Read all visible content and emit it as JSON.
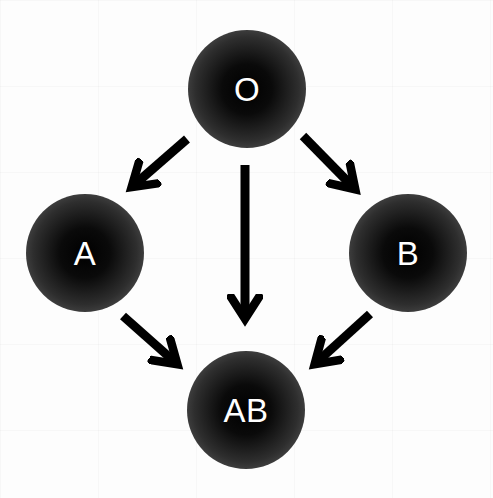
{
  "diagram": {
    "type": "blood-type-compatibility-graph",
    "nodes": [
      {
        "id": "O",
        "label": "O",
        "cx": 247,
        "cy": 89
      },
      {
        "id": "A",
        "label": "A",
        "cx": 85,
        "cy": 253
      },
      {
        "id": "B",
        "label": "B",
        "cx": 408,
        "cy": 253
      },
      {
        "id": "AB",
        "label": "AB",
        "cx": 246,
        "cy": 410
      }
    ],
    "edges": [
      {
        "from": "O",
        "to": "A"
      },
      {
        "from": "O",
        "to": "AB"
      },
      {
        "from": "O",
        "to": "B"
      },
      {
        "from": "A",
        "to": "AB"
      },
      {
        "from": "B",
        "to": "AB"
      }
    ],
    "colors": {
      "node_center": "#000000",
      "node_edge": "#5e5e5e",
      "label": "#ffffff",
      "arrow": "#000000",
      "background": "#ffffff"
    }
  }
}
